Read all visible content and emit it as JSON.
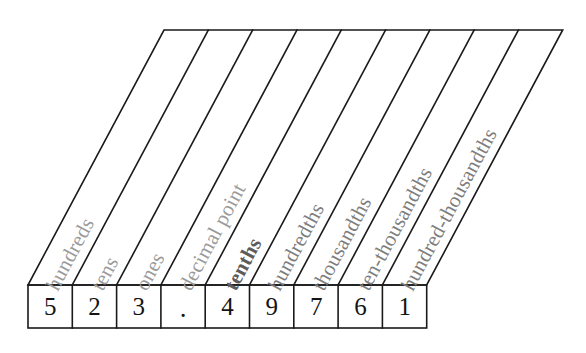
{
  "figure": {
    "kind": "decimal-place-value-chart",
    "number": "523.49761",
    "line_color": "#1a1a1a",
    "label_color": "#9a9a9a",
    "label_color_emphasis": "#5c5c5c",
    "background": "#ffffff"
  },
  "columns": [
    {
      "index": 0,
      "label": "hundreds",
      "digit": "5",
      "emphasis": "light"
    },
    {
      "index": 1,
      "label": "tens",
      "digit": "2",
      "emphasis": "light"
    },
    {
      "index": 2,
      "label": "ones",
      "digit": "3",
      "emphasis": "light"
    },
    {
      "index": 3,
      "label": "decimal point",
      "digit": ".",
      "emphasis": "light"
    },
    {
      "index": 4,
      "label": "tenths",
      "digit": "4",
      "emphasis": "strong"
    },
    {
      "index": 5,
      "label": "hundredths",
      "digit": "9",
      "emphasis": "medium"
    },
    {
      "index": 6,
      "label": "thousandths",
      "digit": "7",
      "emphasis": "medium"
    },
    {
      "index": 7,
      "label": "ten-thousandths",
      "digit": "6",
      "emphasis": "medium"
    },
    {
      "index": 8,
      "label": "hundred-thousandths",
      "digit": "1",
      "emphasis": "medium"
    }
  ],
  "geometry": {
    "top_edge_y": 30,
    "bottom_edge_y": 285,
    "top_left_x": 164,
    "bottom_left_x": 28,
    "column_width": 44.3,
    "column_count": 9,
    "digit_box_height": 43,
    "label_rotation_deg": -62
  }
}
